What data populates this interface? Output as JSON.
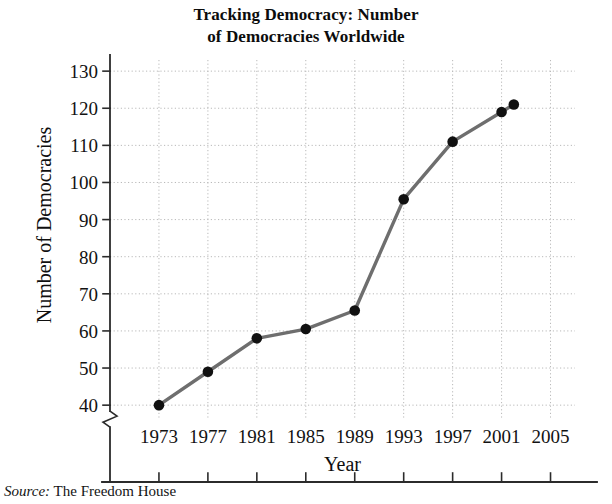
{
  "chart_data": {
    "type": "line",
    "title": "Tracking Democracy: Number of Democracies Worldwide",
    "title_line1": "Tracking Democracy: Number",
    "title_line2": "of Democracies Worldwide",
    "xlabel": "Year",
    "ylabel": "Number of Democracies",
    "x": [
      1973,
      1977,
      1981,
      1985,
      1989,
      1993,
      1997,
      2001,
      2002
    ],
    "values": [
      40,
      49,
      58,
      60.5,
      65.5,
      95.5,
      111,
      119,
      121
    ],
    "series": [
      {
        "name": "Number of Democracies",
        "x": [
          1973,
          1977,
          1981,
          1985,
          1989,
          1993,
          1997,
          2001,
          2002
        ],
        "values": [
          40,
          49,
          58,
          60.5,
          65.5,
          95.5,
          111,
          119,
          121
        ]
      }
    ],
    "xlim": [
      1969,
      2007
    ],
    "ylim": [
      36,
      133
    ],
    "xticks": [
      1973,
      1977,
      1981,
      1985,
      1989,
      1993,
      1997,
      2001,
      2005
    ],
    "xtick_labels": [
      "1973",
      "1977",
      "1981",
      "1985",
      "1989",
      "1993",
      "1997",
      "2001",
      "2005"
    ],
    "yticks": [
      40,
      50,
      60,
      70,
      80,
      90,
      100,
      110,
      120,
      130
    ],
    "ytick_labels": [
      "40",
      "50",
      "60",
      "70",
      "80",
      "90",
      "100",
      "110",
      "120",
      "130"
    ],
    "grid": true,
    "grid_style": "dotted",
    "legend": "none",
    "y_axis_break": true,
    "line_color": "#6e6e6e",
    "marker_color": "#111111",
    "grid_color": "#b9b9b9",
    "axis_color": "#2b2b2b"
  },
  "source": {
    "key": "Source:",
    "value": " The Freedom House"
  }
}
